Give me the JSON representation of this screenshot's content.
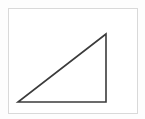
{
  "figure": {
    "title": "Right triangle diagram",
    "caption": "",
    "background_color": "#fdfdfd",
    "canvas": {
      "width": 145,
      "height": 119
    },
    "frame": {
      "name": "figure-border",
      "x": 8,
      "y": 8,
      "width": 129,
      "height": 105,
      "stroke_color": "#d9d9d9",
      "stroke_width": 1,
      "fill_color": "#ffffff"
    },
    "shape": {
      "name": "right-triangle",
      "type": "polygon",
      "stroke_color": "#3b3b3b",
      "stroke_width": 1.6,
      "fill_color": "none",
      "vertices": [
        {
          "label": "bottom-left",
          "x": 18,
          "y": 102
        },
        {
          "label": "bottom-right-right-angle",
          "x": 106,
          "y": 102
        },
        {
          "label": "apex-top",
          "x": 106,
          "y": 34
        }
      ],
      "edges": [
        {
          "name": "base-edge",
          "from": "bottom-left",
          "to": "bottom-right-right-angle"
        },
        {
          "name": "vertical-edge",
          "from": "bottom-right-right-angle",
          "to": "apex-top"
        },
        {
          "name": "hypotenuse-edge",
          "from": "apex-top",
          "to": "bottom-left"
        }
      ]
    },
    "labels": []
  }
}
